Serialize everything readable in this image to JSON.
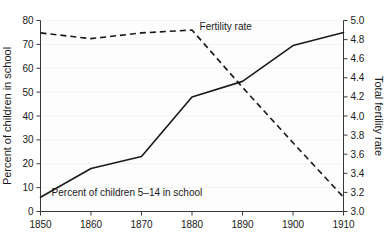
{
  "chart_data": {
    "type": "line",
    "title": "",
    "subtitle": "",
    "xlabel": "",
    "ylabel": "Percent of children in school",
    "y2label": "Total fertility rate",
    "x": [
      1850,
      1860,
      1870,
      1880,
      1890,
      1900,
      1910
    ],
    "xlim": [
      1850,
      1910
    ],
    "ylim": [
      0,
      80
    ],
    "y2lim": [
      3.0,
      5.0
    ],
    "xticks": [
      1850,
      1860,
      1870,
      1880,
      1890,
      1900,
      1910
    ],
    "xtick_labels": [
      "1850",
      "1860",
      "1870",
      "1880",
      "1890",
      "1900",
      "1910"
    ],
    "yticks": [
      0,
      10,
      20,
      30,
      40,
      50,
      60,
      70,
      80
    ],
    "ytick_labels": [
      "0",
      "10",
      "20",
      "30",
      "40",
      "50",
      "60",
      "70",
      "80"
    ],
    "y2ticks": [
      3.0,
      3.2,
      3.4,
      3.6,
      3.8,
      4.0,
      4.2,
      4.4,
      4.6,
      4.8,
      5.0
    ],
    "y2tick_labels": [
      "3.0",
      "3.2",
      "3.4",
      "3.6",
      "3.8",
      "4.0",
      "4.2",
      "4.4",
      "4.6",
      "4.8",
      "5.0"
    ],
    "grid": true,
    "legend_position": "inline-annotations",
    "series": [
      {
        "name": "Percent of children 5–14 in school",
        "axis": "left",
        "style": "solid",
        "color": "#1a1a1a",
        "values": [
          6,
          18,
          23,
          48,
          54.5,
          69.5,
          75
        ]
      },
      {
        "name": "Fertility rate",
        "axis": "right",
        "style": "dashed",
        "color": "#1a1a1a",
        "values": [
          4.87,
          4.81,
          4.87,
          4.9,
          4.3,
          3.72,
          3.15
        ]
      }
    ],
    "annotations": [
      {
        "text": "Fertility rate",
        "x": 1881.5,
        "y_left_scale": 76,
        "anchor": "start"
      },
      {
        "text": "Percent of children 5–14 in school",
        "x": 1852.2,
        "y_left_scale": 6.5,
        "anchor": "start"
      }
    ]
  },
  "axes": {
    "left_title": "Percent of children in school",
    "right_title": "Total fertility rate"
  }
}
